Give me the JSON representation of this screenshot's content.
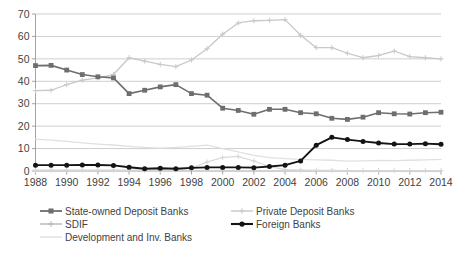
{
  "chart_data": {
    "type": "line",
    "title": "",
    "subtitle": "",
    "xlabel": "",
    "ylabel": "",
    "xlim": [
      1988,
      2014
    ],
    "ylim": [
      0,
      70
    ],
    "y_ticks": [
      0,
      10,
      20,
      30,
      40,
      50,
      60,
      70
    ],
    "x_ticks": [
      1988,
      1990,
      1992,
      1994,
      1996,
      1998,
      2000,
      2002,
      2004,
      2006,
      2008,
      2010,
      2012,
      2014
    ],
    "x_tick_labels": [
      "1988",
      "1990",
      "1992",
      "1994",
      "1996",
      "1998",
      "2000",
      "2002",
      "2004",
      "2006",
      "2008",
      "2010",
      "2012",
      "2014"
    ],
    "y_tick_labels": [
      "0",
      "10",
      "20",
      "30",
      "40",
      "50",
      "60",
      "70"
    ],
    "grid": true,
    "legend_position": "bottom",
    "x": [
      1988,
      1989,
      1990,
      1991,
      1992,
      1993,
      1994,
      1995,
      1996,
      1997,
      1998,
      1999,
      2000,
      2001,
      2002,
      2003,
      2004,
      2005,
      2006,
      2007,
      2008,
      2009,
      2010,
      2011,
      2012,
      2013,
      2014
    ],
    "series": [
      {
        "name": "State-owned Deposit Banks",
        "color": "#6e6e6e",
        "marker": "square",
        "line_width": 1.6,
        "values": [
          47.0,
          47.1,
          45.0,
          43.0,
          42.0,
          41.5,
          34.5,
          36.0,
          37.5,
          38.5,
          34.5,
          33.8,
          28.0,
          27.0,
          25.3,
          27.5,
          27.5,
          26.0,
          25.5,
          23.5,
          23.0,
          24.0,
          26.0,
          25.5,
          25.4,
          26.0,
          26.2
        ]
      },
      {
        "name": "Private Deposit Banks",
        "color": "#c8c8c8",
        "marker": "cross",
        "line_width": 1.3,
        "values": [
          35.8,
          36.0,
          38.5,
          40.5,
          41.5,
          43.0,
          50.5,
          49.0,
          47.5,
          46.5,
          49.5,
          54.5,
          61.0,
          66.0,
          67.0,
          67.2,
          67.5,
          60.5,
          55.0,
          55.0,
          52.5,
          50.5,
          51.5,
          53.5,
          51.0,
          50.5,
          50.0
        ]
      },
      {
        "name": "SDIF",
        "color": "#d6d6d6",
        "marker": "cross",
        "line_width": 1.1,
        "values": [
          0.4,
          0.4,
          0.4,
          0.4,
          0.4,
          0.4,
          0.4,
          0.4,
          0.4,
          0.5,
          1.2,
          4.0,
          6.0,
          6.5,
          4.5,
          2.0,
          0.6,
          0.4,
          0.3,
          0.3,
          0.2,
          0.2,
          0.2,
          0.2,
          0.2,
          0.2,
          0.2
        ]
      },
      {
        "name": "Development and Inv. Banks",
        "color": "#e0e0e0",
        "marker": "none",
        "line_width": 1.3,
        "values": [
          14.2,
          13.8,
          13.2,
          12.5,
          12.0,
          11.6,
          11.0,
          10.5,
          10.2,
          10.5,
          11.0,
          11.5,
          10.0,
          8.5,
          7.0,
          6.0,
          5.5,
          5.2,
          5.0,
          4.8,
          4.4,
          4.5,
          4.7,
          4.6,
          4.8,
          5.0,
          5.2
        ]
      },
      {
        "name": "Foreign Banks",
        "color": "#141414",
        "marker": "circle",
        "line_width": 1.9,
        "values": [
          2.6,
          2.6,
          2.6,
          2.7,
          2.7,
          2.5,
          1.7,
          1.0,
          1.2,
          1.0,
          1.4,
          1.6,
          1.6,
          1.6,
          1.5,
          2.0,
          2.6,
          4.5,
          11.5,
          15.0,
          14.0,
          13.2,
          12.5,
          12.0,
          12.0,
          12.2,
          11.9
        ]
      }
    ]
  },
  "legend": {
    "items": [
      {
        "label": "State-owned Deposit Banks",
        "color": "#6e6e6e",
        "marker": "square"
      },
      {
        "label": "Private Deposit Banks",
        "color": "#c8c8c8",
        "marker": "cross"
      },
      {
        "label": "SDIF",
        "color": "#b6b6b6",
        "marker": "cross"
      },
      {
        "label": "Foreign Banks",
        "color": "#141414",
        "marker": "circle"
      },
      {
        "label": "Development and Inv. Banks",
        "color": "#e0e0e0",
        "marker": "none"
      }
    ]
  }
}
